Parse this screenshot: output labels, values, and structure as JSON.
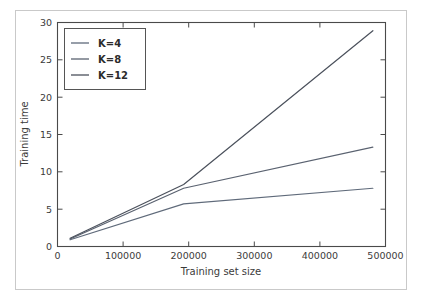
{
  "chart_data": {
    "type": "line",
    "title": "",
    "xlabel": "Training set size",
    "ylabel": "Training time",
    "xlim": [
      0,
      520000
    ],
    "ylim": [
      0,
      30
    ],
    "xticks": [
      0,
      100000,
      200000,
      300000,
      400000,
      500000
    ],
    "xtick_labels": [
      "0",
      "100000",
      "200000",
      "300000",
      "400000",
      "500000"
    ],
    "yticks": [
      0,
      5,
      10,
      15,
      20,
      25,
      30
    ],
    "ytick_labels": [
      "0",
      "5",
      "10",
      "15",
      "20",
      "25",
      "30"
    ],
    "grid": false,
    "legend_position": "upper left",
    "x": [
      20000,
      200000,
      500000
    ],
    "series": [
      {
        "name": "K=4",
        "label": "K=4",
        "color": "#5f6a7a",
        "values": [
          0.9,
          5.7,
          7.8
        ]
      },
      {
        "name": "K=8",
        "label": "K=8",
        "color": "#5a6270",
        "values": [
          1.0,
          7.8,
          13.3
        ]
      },
      {
        "name": "K=12",
        "label": "K=12",
        "color": "#4b515c",
        "values": [
          1.1,
          8.3,
          28.9
        ]
      }
    ]
  },
  "legend": {
    "entries": [
      {
        "label": "K=4"
      },
      {
        "label": "K=8"
      },
      {
        "label": "K=12"
      }
    ]
  },
  "axes": {
    "x_title": "Training set size",
    "y_title": "Training time",
    "x_tick_labels": [
      "0",
      "100000",
      "200000",
      "300000",
      "400000",
      "500000"
    ],
    "y_tick_labels": [
      "0",
      "5",
      "10",
      "15",
      "20",
      "25",
      "30"
    ]
  },
  "colors": {
    "spine": "#4a4a4a",
    "frame": "#c9c9c9",
    "background": "#ffffff",
    "text": "#3b3b3b"
  }
}
